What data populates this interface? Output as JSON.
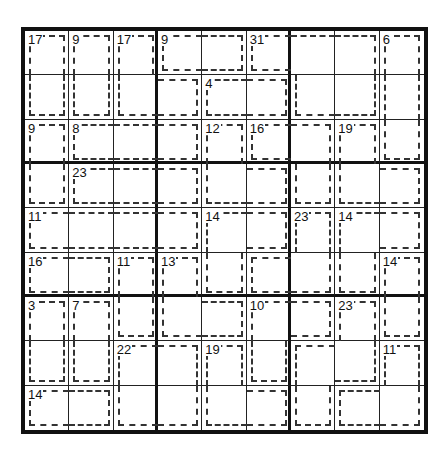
{
  "puzzle": {
    "type": "Killer Sudoku",
    "size": 9,
    "cages": [
      {
        "sum": 17,
        "cells": [
          [
            1,
            1
          ],
          [
            2,
            1
          ]
        ]
      },
      {
        "sum": 9,
        "cells": [
          [
            1,
            2
          ],
          [
            2,
            2
          ]
        ]
      },
      {
        "sum": 17,
        "cells": [
          [
            1,
            3
          ],
          [
            2,
            3
          ],
          [
            2,
            4
          ]
        ]
      },
      {
        "sum": 9,
        "cells": [
          [
            1,
            4
          ],
          [
            1,
            5
          ]
        ]
      },
      {
        "sum": 31,
        "cells": [
          [
            1,
            6
          ],
          [
            1,
            7
          ],
          [
            1,
            8
          ],
          [
            2,
            7
          ],
          [
            2,
            8
          ]
        ]
      },
      {
        "sum": 6,
        "cells": [
          [
            1,
            9
          ],
          [
            2,
            9
          ],
          [
            3,
            9
          ]
        ]
      },
      {
        "sum": 4,
        "cells": [
          [
            2,
            5
          ],
          [
            2,
            6
          ]
        ]
      },
      {
        "sum": 9,
        "cells": [
          [
            3,
            1
          ],
          [
            4,
            1
          ]
        ]
      },
      {
        "sum": 8,
        "cells": [
          [
            3,
            2
          ],
          [
            3,
            3
          ],
          [
            3,
            4
          ]
        ]
      },
      {
        "sum": 12,
        "cells": [
          [
            3,
            5
          ],
          [
            4,
            5
          ],
          [
            4,
            6
          ]
        ]
      },
      {
        "sum": 16,
        "cells": [
          [
            3,
            6
          ],
          [
            3,
            7
          ],
          [
            4,
            7
          ]
        ]
      },
      {
        "sum": 19,
        "cells": [
          [
            3,
            8
          ],
          [
            4,
            8
          ],
          [
            4,
            9
          ]
        ]
      },
      {
        "sum": 23,
        "cells": [
          [
            4,
            2
          ],
          [
            4,
            3
          ],
          [
            4,
            4
          ]
        ]
      },
      {
        "sum": 11,
        "cells": [
          [
            5,
            1
          ],
          [
            5,
            2
          ],
          [
            5,
            3
          ],
          [
            5,
            4
          ]
        ]
      },
      {
        "sum": 14,
        "cells": [
          [
            5,
            5
          ],
          [
            5,
            6
          ],
          [
            6,
            5
          ]
        ]
      },
      {
        "sum": 23,
        "cells": [
          [
            5,
            7
          ],
          [
            6,
            6
          ],
          [
            6,
            7
          ]
        ]
      },
      {
        "sum": 14,
        "cells": [
          [
            5,
            8
          ],
          [
            5,
            9
          ],
          [
            6,
            8
          ]
        ]
      },
      {
        "sum": 16,
        "cells": [
          [
            6,
            1
          ],
          [
            6,
            2
          ]
        ]
      },
      {
        "sum": 11,
        "cells": [
          [
            6,
            3
          ],
          [
            7,
            3
          ]
        ]
      },
      {
        "sum": 13,
        "cells": [
          [
            6,
            4
          ],
          [
            7,
            4
          ],
          [
            7,
            5
          ]
        ]
      },
      {
        "sum": 14,
        "cells": [
          [
            6,
            9
          ],
          [
            7,
            9
          ]
        ]
      },
      {
        "sum": 3,
        "cells": [
          [
            7,
            1
          ],
          [
            8,
            1
          ]
        ]
      },
      {
        "sum": 7,
        "cells": [
          [
            7,
            2
          ],
          [
            8,
            2
          ]
        ]
      },
      {
        "sum": 10,
        "cells": [
          [
            7,
            6
          ],
          [
            7,
            7
          ],
          [
            8,
            6
          ]
        ]
      },
      {
        "sum": 23,
        "cells": [
          [
            7,
            8
          ],
          [
            8,
            7
          ],
          [
            8,
            8
          ],
          [
            9,
            7
          ]
        ]
      },
      {
        "sum": 22,
        "cells": [
          [
            8,
            3
          ],
          [
            8,
            4
          ],
          [
            9,
            3
          ],
          [
            9,
            4
          ]
        ]
      },
      {
        "sum": 19,
        "cells": [
          [
            8,
            5
          ],
          [
            9,
            5
          ],
          [
            9,
            6
          ]
        ]
      },
      {
        "sum": 11,
        "cells": [
          [
            8,
            9
          ],
          [
            9,
            8
          ],
          [
            9,
            9
          ]
        ]
      },
      {
        "sum": 14,
        "cells": [
          [
            9,
            1
          ],
          [
            9,
            2
          ]
        ]
      }
    ],
    "values": [
      [
        "",
        "",
        "",
        "",
        "",
        "",
        "",
        "",
        ""
      ],
      [
        "",
        "",
        "",
        "",
        "",
        "",
        "",
        "",
        ""
      ],
      [
        "",
        "",
        "",
        "",
        "",
        "",
        "",
        "",
        ""
      ],
      [
        "",
        "",
        "",
        "",
        "",
        "",
        "",
        "",
        ""
      ],
      [
        "",
        "",
        "",
        "",
        "",
        "",
        "",
        "",
        ""
      ],
      [
        "",
        "",
        "",
        "",
        "",
        "",
        "",
        "",
        ""
      ],
      [
        "",
        "",
        "",
        "",
        "",
        "",
        "",
        "",
        ""
      ],
      [
        "",
        "",
        "",
        "",
        "",
        "",
        "",
        "",
        ""
      ],
      [
        "",
        "",
        "",
        "",
        "",
        "",
        "",
        "",
        ""
      ]
    ]
  }
}
